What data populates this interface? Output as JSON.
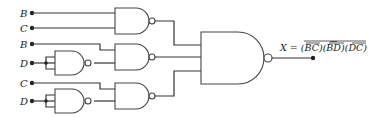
{
  "diagram": {
    "type": "logic-circuit",
    "inputs": [
      {
        "label": "B",
        "y": 13
      },
      {
        "label": "C",
        "y": 28
      },
      {
        "label": "B",
        "y": 44
      },
      {
        "label": "D",
        "y": 63
      },
      {
        "label": "C",
        "y": 83
      },
      {
        "label": "D",
        "y": 101
      }
    ],
    "gates": [
      {
        "id": "nand-bc",
        "type": "NAND",
        "inputs": [
          "B",
          "C"
        ]
      },
      {
        "id": "inv-d1",
        "type": "NAND (inverter)",
        "inputs": [
          "D",
          "D"
        ]
      },
      {
        "id": "nand-bd",
        "type": "NAND",
        "inputs": [
          "B",
          "D̄"
        ]
      },
      {
        "id": "inv-d2",
        "type": "NAND (inverter)",
        "inputs": [
          "D",
          "D"
        ]
      },
      {
        "id": "nand-dc",
        "type": "NAND",
        "inputs": [
          "D̄",
          "C"
        ]
      },
      {
        "id": "nand-out",
        "type": "NAND",
        "inputs": [
          "nand-bc",
          "nand-bd",
          "nand-dc"
        ]
      }
    ],
    "output": {
      "label": "X",
      "equation_prefix": "X = (",
      "term1": "BC",
      "term2": "BD",
      "term3": "DC",
      "sep1": ")(",
      "sep2": ")(",
      "suffix": ")"
    }
  }
}
